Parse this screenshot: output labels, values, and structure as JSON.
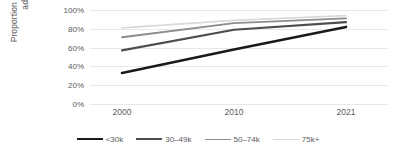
{
  "chart_data": {
    "type": "line",
    "title": "",
    "subtitle": "",
    "xlabel": "",
    "ylabel": "Proportion of American adults",
    "x": [
      "2000",
      "2010",
      "2021"
    ],
    "categories": [
      "2000",
      "2010",
      "2021"
    ],
    "ylim": [
      0,
      1.0
    ],
    "ytick_labels": [
      "0%",
      "20%",
      "40%",
      "60%",
      "80%",
      "100%"
    ],
    "ytick_values": [
      0,
      20,
      40,
      60,
      80,
      100
    ],
    "grid": true,
    "legend_position": "bottom",
    "series": [
      {
        "name": "<30k",
        "values": [
          33,
          58,
          82
        ],
        "color": "#1a1a1a"
      },
      {
        "name": "30–49k",
        "values": [
          57,
          79,
          87
        ],
        "color": "#4d4d4d"
      },
      {
        "name": "50–74k",
        "values": [
          71,
          86,
          91
        ],
        "color": "#8c8c8c"
      },
      {
        "name": "75k+",
        "values": [
          81,
          89,
          94
        ],
        "color": "#d9d9d9"
      }
    ]
  },
  "axes": {
    "y_title_line1": "Proportion of American",
    "y_title_line2": "adults"
  }
}
